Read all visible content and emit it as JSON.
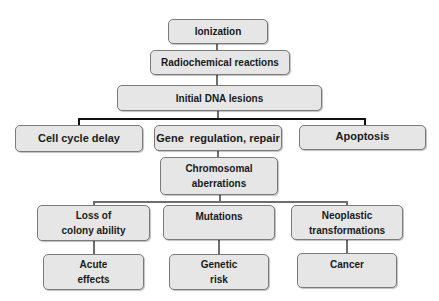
{
  "diagram": {
    "type": "flowchart",
    "nodes": {
      "ionization": "Ionization",
      "radiochemical": "Radiochemical reactions",
      "initial_dna": "Initial DNA lesions",
      "cell_cycle": "Cell cycle delay",
      "gene_regulation": "Gene  regulation, repair",
      "apoptosis": "Apoptosis",
      "chromosomal_1": "Chromosomal",
      "chromosomal_2": "aberrations",
      "loss_1": "Loss of",
      "loss_2": "colony ability",
      "mutations": "Mutations",
      "neoplastic_1": "Neoplastic",
      "neoplastic_2": "transformations",
      "acute_1": "Acute",
      "acute_2": "effects",
      "genetic_1": "Genetic",
      "genetic_2": "risk",
      "cancer": "Cancer"
    },
    "edges": [
      [
        "Ionization",
        "Radiochemical reactions"
      ],
      [
        "Radiochemical reactions",
        "Initial DNA lesions"
      ],
      [
        "Initial DNA lesions",
        "Cell cycle delay"
      ],
      [
        "Initial DNA lesions",
        "Gene regulation, repair"
      ],
      [
        "Initial DNA lesions",
        "Apoptosis"
      ],
      [
        "Gene regulation, repair",
        "Chromosomal aberrations"
      ],
      [
        "Chromosomal aberrations",
        "Loss of colony ability"
      ],
      [
        "Chromosomal aberrations",
        "Mutations"
      ],
      [
        "Chromosomal aberrations",
        "Neoplastic transformations"
      ],
      [
        "Loss of colony ability",
        "Acute effects"
      ],
      [
        "Mutations",
        "Genetic risk"
      ],
      [
        "Neoplastic transformations",
        "Cancer"
      ]
    ],
    "colors": {
      "box_fill": "#e6e6e6",
      "box_border": "#7a7a7a",
      "connector": "#6e6e6e",
      "branch_connector": "#111111"
    }
  }
}
